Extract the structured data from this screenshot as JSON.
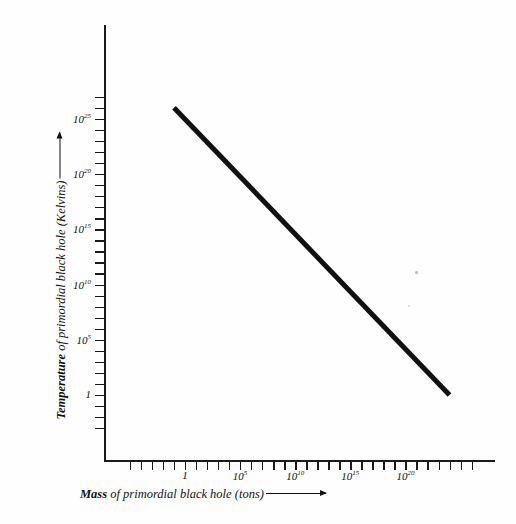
{
  "chart_data": {
    "type": "line",
    "title": "",
    "xlabel": "Mass of primordial black hole (tons)",
    "ylabel": "Temperature of primordial black hole (Kelvins)",
    "xlabel_bold_word": "Mass",
    "xlabel_rest": " of primordial black hole (tons)",
    "ylabel_bold_word": "Temperature",
    "ylabel_rest": " of primordial black hole (Kelvins)",
    "xscale": "log",
    "yscale": "log",
    "grid": false,
    "legend": "none",
    "x_tick_labels": [
      "1",
      "10",
      "10",
      "10",
      "10"
    ],
    "x_tick_exponents": [
      "",
      "5",
      "10",
      "15",
      "20"
    ],
    "x_tick_values": [
      1,
      100000,
      10000000000,
      1000000000000000,
      100000000000000000000
    ],
    "y_tick_labels": [
      "10",
      "10",
      "10",
      "10",
      "10",
      "1"
    ],
    "y_tick_exponents": [
      "25",
      "20",
      "15",
      "10",
      "5",
      ""
    ],
    "y_tick_values": [
      1e+25,
      1e+20,
      1000000000000000.0,
      10000000000.0,
      100000,
      1
    ],
    "xlim_exponent": [
      -2,
      25
    ],
    "ylim_exponent": [
      -3,
      27
    ],
    "series": [
      {
        "name": "Hawking temperature",
        "slope": -1,
        "x": [
          0.1,
          1e+24
        ],
        "y": [
          1e+26,
          1.0
        ],
        "color": "#111111",
        "linewidth": 5
      }
    ],
    "annotations": []
  },
  "axes": {
    "x_axis_name": "mass-axis",
    "y_axis_name": "temperature-axis",
    "x_arrow": true,
    "y_arrow": true
  }
}
